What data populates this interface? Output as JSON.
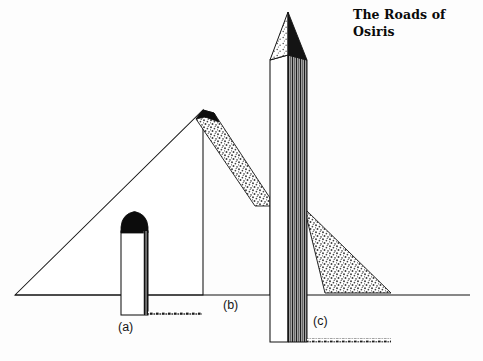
{
  "figure": {
    "title_line1": "The Roads of",
    "title_line2": "Osiris",
    "background_color": "#fdfdfd",
    "ink_color": "#111111",
    "stipple_color": "#4a4a4a",
    "labels": [
      {
        "key": "a",
        "text": "(a)",
        "subject": "round-topped-column"
      },
      {
        "key": "b",
        "text": "(b)",
        "subject": "pyramid"
      },
      {
        "key": "c",
        "text": "(c)",
        "subject": "obelisk"
      }
    ],
    "ground_line": {
      "name": "horizon-ground-line",
      "y": 295,
      "x_start": 15,
      "x_end": 470
    },
    "monuments": [
      {
        "id": "a",
        "name": "round-topped-column",
        "description": "White rectangular shaft with solid black domed cap, short dark ground shadow to the right",
        "cap_fill": "#111111",
        "body_fill": "#ffffff",
        "apex_y": 212,
        "base_y": 315,
        "left_x": 121,
        "right_x": 148
      },
      {
        "id": "b",
        "name": "pyramid",
        "description": "Large outlined triangle with stippled shadow band falling down and to the right of the apex",
        "face_fill": "#ffffff",
        "shadow_fill": "stipple",
        "apex_x": 203,
        "apex_y": 110,
        "left_base_x": 15,
        "base_y": 295
      },
      {
        "id": "c",
        "name": "obelisk",
        "description": "Tall slender shaft with pyramidion cap; left face white, right face dense vertical hatching; stippled triangular cast shadow on the ground",
        "shaft_fill": "#ffffff",
        "hatch_fill": "#3c3c3c",
        "apex_x": 288,
        "apex_y": 12,
        "left_x": 270,
        "right_x": 307,
        "base_y": 342
      }
    ],
    "shadows": [
      {
        "name": "column-ground-shadow",
        "type": "line",
        "owner": "a"
      },
      {
        "name": "pyramid-face-shadow",
        "type": "stipple-band",
        "owner": "b"
      },
      {
        "name": "obelisk-cast-shadow",
        "type": "stipple-triangle",
        "owner": "c"
      },
      {
        "name": "obelisk-ground-shadow",
        "type": "line",
        "owner": "c"
      }
    ]
  }
}
